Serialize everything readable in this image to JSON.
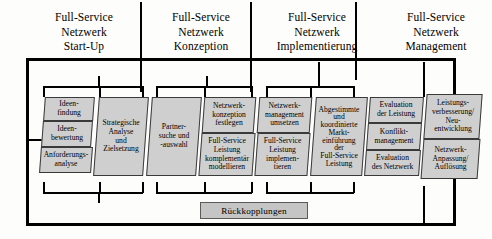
{
  "phases": [
    {
      "id": "start-up",
      "lines": [
        "Full-Service",
        "Netzwerk",
        "Start-Up"
      ]
    },
    {
      "id": "konzeption",
      "lines": [
        "Full-Service",
        "Netzwerk",
        "Konzeption"
      ]
    },
    {
      "id": "implementierung",
      "lines": [
        "Full-Service",
        "Netzwerk",
        "Implementierung"
      ]
    },
    {
      "id": "management",
      "lines": [
        "Full-Service",
        "Netzwerk",
        "Management"
      ]
    }
  ],
  "columns": [
    {
      "id": "ideen",
      "boxes": [
        {
          "id": "ideenfindung",
          "lines": [
            "Ideen-",
            "findung"
          ]
        },
        {
          "id": "ideenbewertung",
          "lines": [
            "Ideen-",
            "bewertung"
          ]
        },
        {
          "id": "anforderungsanalyse",
          "lines": [
            "Anforderungs-",
            "analyse"
          ]
        }
      ]
    },
    {
      "id": "strategie",
      "boxes": [
        {
          "id": "strategische-analyse",
          "lines": [
            "Strategische",
            "Analyse",
            "und",
            "Zielsetzung"
          ]
        }
      ]
    },
    {
      "id": "partner",
      "boxes": [
        {
          "id": "partnersuche",
          "lines": [
            "Partner-",
            "suche und",
            "-auswahl"
          ]
        }
      ]
    },
    {
      "id": "netzwerkkonzeption",
      "boxes": [
        {
          "id": "konzeption-festlegen",
          "lines": [
            "Netzwerk-",
            "konzeption",
            "festlegen"
          ]
        },
        {
          "id": "leistung-modellieren",
          "lines": [
            "Full-Service",
            "Leistung",
            "komplementär",
            "modellieren"
          ]
        }
      ]
    },
    {
      "id": "netzwerkmanagement",
      "boxes": [
        {
          "id": "management-umsetzen",
          "lines": [
            "Netzwerk-",
            "management",
            "umsetzen"
          ]
        },
        {
          "id": "leistung-implementieren",
          "lines": [
            "Full-Service",
            "Leistung",
            "implemen-",
            "tieren"
          ]
        }
      ]
    },
    {
      "id": "markteinfuehrung",
      "boxes": [
        {
          "id": "abgestimmte-markteinfuehrung",
          "lines": [
            "Abgestimmte",
            "und",
            "koordinierte",
            "Markt-",
            "einführung",
            "der",
            "Full-Service",
            "Leistung"
          ]
        }
      ]
    },
    {
      "id": "evaluation",
      "boxes": [
        {
          "id": "evaluation-leistung",
          "lines": [
            "Evaluation",
            "der Leistung"
          ]
        },
        {
          "id": "konfliktmanagement",
          "lines": [
            "Konflikt-",
            "management"
          ]
        },
        {
          "id": "evaluation-netzwerk",
          "lines": [
            "Evaluation",
            "des Netzwerk"
          ]
        }
      ]
    },
    {
      "id": "leistungsverbesserung",
      "boxes": [
        {
          "id": "verbesserung-neuentwicklung",
          "lines": [
            "Leistungs-",
            "verbesserung/",
            "Neu-",
            "entwicklung"
          ]
        },
        {
          "id": "anpassung-aufloesung",
          "lines": [
            "Netzwerk-",
            "Anpassung/",
            "Auflösung"
          ]
        }
      ]
    }
  ],
  "feedback": {
    "label": "Rückkopplungen"
  },
  "colors": {
    "box_fill": "#cfcfcf",
    "feedback_fill": "#c5c5c5",
    "line": "#000000",
    "background": "#fdfdfb"
  }
}
